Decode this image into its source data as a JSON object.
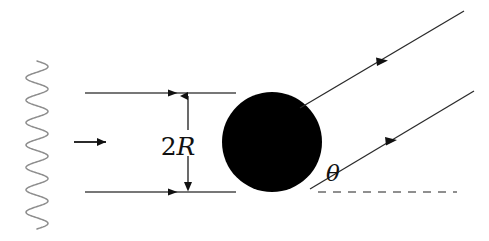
{
  "figure": {
    "background_color": "#ffffff",
    "width": 489,
    "height": 241
  },
  "colors": {
    "ray_stroke": "#4a4a4a",
    "wave_stroke": "#8d8d8d",
    "sphere_fill": "#000000",
    "dashed_stroke": "#6b6b6b",
    "label_color": "#111111"
  },
  "labels": {
    "diameter": {
      "number": "2",
      "symbol": "R",
      "full_text": "2R",
      "x": 178,
      "y": 155
    },
    "angle": {
      "symbol": "θ",
      "full_text": "θ",
      "x": 333,
      "y": 181
    }
  },
  "wavefront": {
    "name": "incident-plane-wave",
    "x_center": 37,
    "y_top": 61,
    "y_bottom": 229,
    "amplitude": 11,
    "cycles": 7.5
  },
  "propagation_arrow": {
    "name": "propagation-direction-arrow",
    "x1": 74,
    "y1": 142,
    "x2": 109,
    "y2": 142
  },
  "incident_rays": [
    {
      "name": "incident-ray-top",
      "x1": 85,
      "y1": 93,
      "x2": 232,
      "y2": 93,
      "arrow_at_x": 176
    },
    {
      "name": "incident-ray-bottom",
      "x1": 85,
      "y1": 192,
      "x2": 232,
      "y2": 192,
      "arrow_at_x": 176
    }
  ],
  "sphere": {
    "name": "opaque-sphere",
    "cx": 272,
    "cy": 142,
    "r": 50,
    "diameter_value": "2R"
  },
  "dimension_line": {
    "name": "diameter-dimension",
    "x": 188,
    "y_top": 93,
    "y_bottom": 192,
    "label": "2R"
  },
  "scattered_rays": [
    {
      "name": "scattered-ray-upper",
      "x1": 305,
      "y1": 105,
      "x2": 464,
      "y2": 11,
      "arrow_at_t": 0.52
    },
    {
      "name": "scattered-ray-lower",
      "x1": 312,
      "y1": 188,
      "x2": 472,
      "y2": 92,
      "arrow_at_t": 0.52
    }
  ],
  "reference_line": {
    "name": "horizontal-reference-dashed",
    "x1": 318,
    "y1": 192,
    "x2": 457,
    "y2": 192,
    "style": "dashed"
  },
  "chart_data": {
    "type": "diagram",
    "elements": [
      "incident plane wave (sinusoidal wavefront)",
      "two parallel incident rays separated by 2R",
      "opaque sphere of diameter 2R",
      "two parallel scattered rays deflected by angle theta",
      "dashed horizontal reference line defining theta"
    ],
    "annotations": [
      "2R",
      "θ"
    ]
  }
}
